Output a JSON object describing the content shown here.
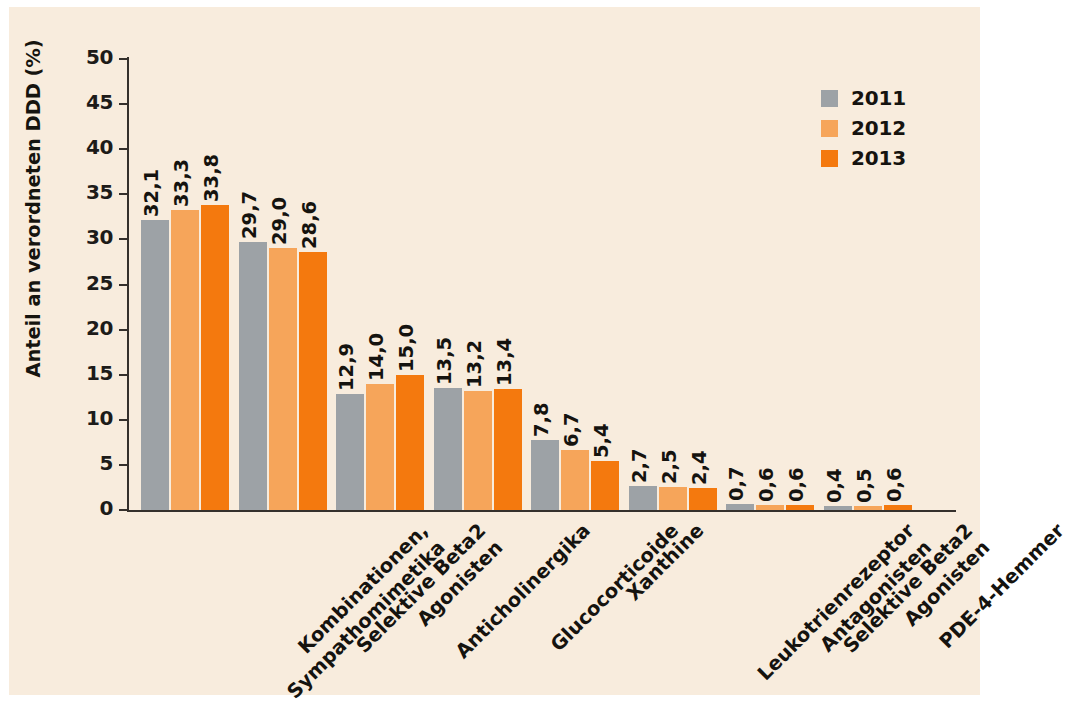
{
  "chart_data": {
    "type": "bar",
    "title": "",
    "xlabel": "",
    "ylabel": "Anteil an verordneten DDD (%)",
    "ylim": [
      0,
      50
    ],
    "ytick_step": 5,
    "yticks": [
      "0",
      "5",
      "10",
      "15",
      "20",
      "25",
      "30",
      "35",
      "40",
      "45",
      "50"
    ],
    "grid": false,
    "legend_position": "top-right",
    "categories": [
      "Kombinationen, Sympathomimetika",
      "Selektive Beta2 Agonisten",
      "Anticholinergika",
      "Glucocorticoide",
      "Xanthine",
      "Leukotrienrezeptor Antagonisten",
      "Selektive Beta2 Agonisten",
      "PDE-4-Hemmer"
    ],
    "category_lines": [
      [
        "Kombinationen,",
        "Sympathomimetika"
      ],
      [
        "Selektive Beta2",
        "Agonisten"
      ],
      [
        "Anticholinergika",
        ""
      ],
      [
        "Glucocorticoide",
        ""
      ],
      [
        "Xanthine",
        ""
      ],
      [
        "Leukotrienrezeptor",
        "Antagonisten"
      ],
      [
        "Selektive Beta2",
        "Agonisten"
      ],
      [
        "PDE-4-Hemmer",
        ""
      ]
    ],
    "series": [
      {
        "name": "2011",
        "color": "#9da2a6",
        "values": [
          32.1,
          29.7,
          12.9,
          13.5,
          7.8,
          2.7,
          0.7,
          0.4
        ],
        "labels": [
          "32,1",
          "29,7",
          "12,9",
          "13,5",
          "7,8",
          "2,7",
          "0,7",
          "0,4"
        ]
      },
      {
        "name": "2012",
        "color": "#f6a55a",
        "values": [
          33.3,
          29.0,
          14.0,
          13.2,
          6.7,
          2.5,
          0.6,
          0.5
        ],
        "labels": [
          "33,3",
          "29,0",
          "14,0",
          "13,2",
          "6,7",
          "2,5",
          "0,6",
          "0,5"
        ]
      },
      {
        "name": "2013",
        "color": "#f4790e",
        "values": [
          33.8,
          28.6,
          15.0,
          13.4,
          5.4,
          2.4,
          0.6,
          0.6
        ],
        "labels": [
          "33,8",
          "28,6",
          "15,0",
          "13,4",
          "5,4",
          "2,4",
          "0,6",
          "0,6"
        ]
      }
    ]
  },
  "legend": {
    "items": [
      {
        "label": "2011",
        "color": "#9da2a6"
      },
      {
        "label": "2012",
        "color": "#f6a55a"
      },
      {
        "label": "2013",
        "color": "#f4790e"
      }
    ]
  },
  "colors": {
    "background": "#f8ecdd",
    "axis": "#35302c",
    "text": "#15130f",
    "series_2011": "#9da2a6",
    "series_2012": "#f6a55a",
    "series_2013": "#f4790e"
  }
}
